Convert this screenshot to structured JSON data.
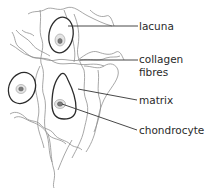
{
  "diagram": {
    "labels": [
      {
        "id": "lacuna",
        "text": "lacuna"
      },
      {
        "id": "collagen",
        "line1": "collagen",
        "line2": "fibres"
      },
      {
        "id": "matrix",
        "text": "matrix"
      },
      {
        "id": "chondrocyte",
        "text": "chondrocyte"
      }
    ],
    "colors": {
      "background": "#ffffff",
      "fibre": "#8a8a8a",
      "outline": "#2b2b2b",
      "text": "#2a2a2a"
    }
  }
}
